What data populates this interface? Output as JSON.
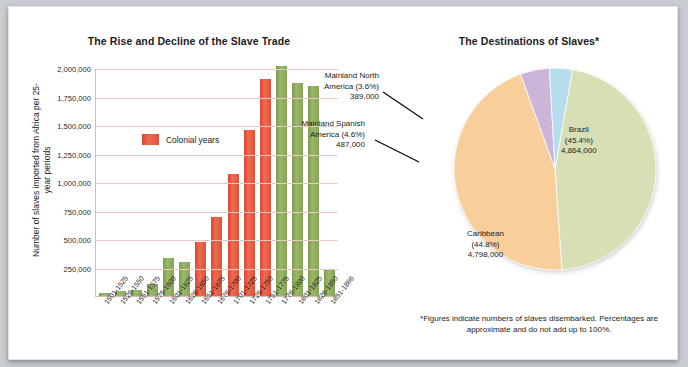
{
  "bar_panel": {
    "title": "The Rise and Decline of the Slave Trade",
    "y_axis_title": "Number of slaves imported from Africa per 25-year periods",
    "legend_label": "Colonial years"
  },
  "pie_panel": {
    "title": "The Destinations of Slaves*",
    "footnote": "*Figures indicate numbers of slaves disembarked. Percentages are approximate and do not add up to 100%.",
    "labels": {
      "north_america": {
        "name": "Mainland North America (3.6%)",
        "line1": "Mainland North",
        "line2": "America (3.6%)",
        "value": "389,000"
      },
      "spanish_america": {
        "name": "Mainland Spanish America (4.6%)",
        "line1": "Mainland Spanish",
        "line2": "America (4.6%)",
        "value": "487,000"
      },
      "brazil": {
        "name": "Brazil",
        "line1": "Brazil",
        "line2": "(45.4%)",
        "value": "4,864,000"
      },
      "caribbean": {
        "name": "Caribbean",
        "line1": "Caribbean",
        "line2": "(44.8%)",
        "value": "4,798,000"
      }
    }
  },
  "colors": {
    "colonial_red": "#e0523a",
    "green": "#8aa857",
    "pie_brazil": "#d9dfb4",
    "pie_caribbean": "#f8cf9b",
    "pie_spanish": "#cbb6d8",
    "pie_north_america": "#b6dced",
    "gridline": "#e7cac4"
  },
  "chart_data": [
    {
      "type": "bar",
      "title": "The Rise and Decline of the Slave Trade",
      "xlabel": "",
      "ylabel": "Number of slaves imported from Africa per 25-year periods",
      "ylim": [
        0,
        2000000
      ],
      "yticks": [
        "250,000",
        "500,000",
        "750,000",
        "1,000,000",
        "1,250,000",
        "1,500,000",
        "1,750,000",
        "2,000,000"
      ],
      "ytick_values": [
        250000,
        500000,
        750000,
        1000000,
        1250000,
        1500000,
        1750000,
        2000000
      ],
      "grid": true,
      "legend": [
        {
          "label": "Colonial years",
          "color": "#e0523a"
        }
      ],
      "categories": [
        "1501-1525",
        "1526-1550",
        "1551-1575",
        "1576-1600",
        "1601-1625",
        "1626-1650",
        "1651-1675",
        "1676-1700",
        "1701-1725",
        "1726-1750",
        "1751-1775",
        "1776-1800",
        "1801-1825",
        "1826-1850",
        "1851-1866"
      ],
      "values": [
        25000,
        45000,
        55000,
        105000,
        335000,
        300000,
        470000,
        690000,
        1070000,
        1460000,
        1905000,
        2015000,
        1870000,
        1845000,
        240000
      ],
      "bar_colors": [
        "green",
        "green",
        "green",
        "green",
        "green",
        "green",
        "red",
        "red",
        "red",
        "red",
        "red",
        "green",
        "green",
        "green",
        "green"
      ]
    },
    {
      "type": "pie",
      "title": "The Destinations of Slaves*",
      "labels": [
        "Brazil",
        "Caribbean",
        "Mainland Spanish America",
        "Mainland North America"
      ],
      "values": [
        4864000,
        4798000,
        487000,
        389000
      ],
      "percentages": [
        45.4,
        44.8,
        4.6,
        3.6
      ],
      "slice_colors": [
        "#d9dfb4",
        "#f8cf9b",
        "#cbb6d8",
        "#b6dced"
      ],
      "legend_position": "callout-labels"
    }
  ]
}
